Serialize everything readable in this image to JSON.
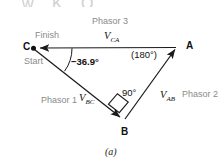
{
  "figure": {
    "caption": "(a)",
    "top_fragment": "w  K  O",
    "colors": {
      "stroke": "#1a1a1a",
      "annotation_gray": "#8a8a8a",
      "label_black": "#111111",
      "background": "#ffffff"
    }
  },
  "vertices": {
    "a": {
      "label": "A",
      "x": 177,
      "y": 47
    },
    "b": {
      "label": "B",
      "x": 124,
      "y": 120
    },
    "c": {
      "label": "C",
      "x": 33,
      "y": 48
    }
  },
  "markers": {
    "start": "Start",
    "finish": "Finish"
  },
  "phasors": [
    {
      "name": "Phasor 1",
      "symbol": "V",
      "subscript": "BC",
      "from": "C",
      "to": "B",
      "label": "Phasor 1"
    },
    {
      "name": "Phasor 2",
      "symbol": "V",
      "subscript": "AB",
      "from": "B",
      "to": "A",
      "label": "Phasor 2"
    },
    {
      "name": "Phasor 3",
      "symbol": "V",
      "subscript": "CA",
      "from": "A",
      "to": "C",
      "label": "Phasor 3"
    }
  ],
  "angles": {
    "at_c": "−36.9°",
    "at_c_value": "-36.9",
    "at_a": "(180°)",
    "at_a_value": "180",
    "at_b": "90°",
    "at_b_value": "90",
    "right_angle_marker": "square"
  }
}
